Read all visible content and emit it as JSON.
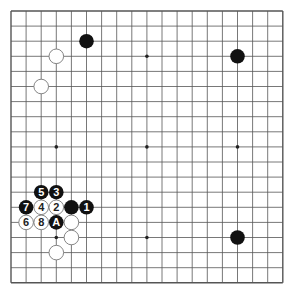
{
  "board": {
    "size": 19,
    "origin_x": 11,
    "origin_y": 11,
    "spacing": 15.1,
    "star_points": [
      [
        3,
        3
      ],
      [
        9,
        3
      ],
      [
        15,
        3
      ],
      [
        3,
        9
      ],
      [
        9,
        9
      ],
      [
        15,
        9
      ],
      [
        3,
        15
      ],
      [
        9,
        15
      ],
      [
        15,
        15
      ]
    ],
    "colors": {
      "line": "#555555",
      "black": "#111111",
      "white": "#ffffff",
      "white_border": "#777777"
    }
  },
  "stones": [
    {
      "color": "black",
      "col": 5,
      "row": 2,
      "label": ""
    },
    {
      "color": "white",
      "col": 3,
      "row": 3,
      "label": ""
    },
    {
      "color": "white",
      "col": 2,
      "row": 5,
      "label": ""
    },
    {
      "color": "black",
      "col": 15,
      "row": 3,
      "label": ""
    },
    {
      "color": "black",
      "col": 15,
      "row": 15,
      "label": ""
    },
    {
      "color": "black",
      "col": 2,
      "row": 12,
      "label": "5"
    },
    {
      "color": "black",
      "col": 3,
      "row": 12,
      "label": "3"
    },
    {
      "color": "black",
      "col": 1,
      "row": 13,
      "label": "7"
    },
    {
      "color": "white",
      "col": 2,
      "row": 13,
      "label": "4"
    },
    {
      "color": "white",
      "col": 3,
      "row": 13,
      "label": "2"
    },
    {
      "color": "black",
      "col": 4,
      "row": 13,
      "label": ""
    },
    {
      "color": "black",
      "col": 5,
      "row": 13,
      "label": "1"
    },
    {
      "color": "white",
      "col": 1,
      "row": 14,
      "label": "6"
    },
    {
      "color": "white",
      "col": 2,
      "row": 14,
      "label": "8"
    },
    {
      "color": "black",
      "col": 3,
      "row": 14,
      "label": "A"
    },
    {
      "color": "white",
      "col": 4,
      "row": 14,
      "label": ""
    },
    {
      "color": "white",
      "col": 4,
      "row": 15,
      "label": ""
    },
    {
      "color": "white",
      "col": 3,
      "row": 16,
      "label": ""
    }
  ]
}
